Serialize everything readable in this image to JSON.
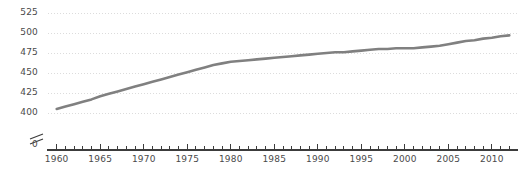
{
  "chart_data": {
    "type": "line",
    "title": "",
    "subtitle": "",
    "xlabel": "",
    "ylabel": "",
    "grid": true,
    "legend": null,
    "legend_position": "none",
    "axis_break": true,
    "axis_break_note": "y-axis broken between 0 and 400",
    "xlim": [
      1959,
      2013
    ],
    "ylim": [
      400,
      530
    ],
    "y_zero_tick": "0",
    "yticks": [
      400,
      425,
      450,
      475,
      500,
      525
    ],
    "ytick_labels": [
      "400",
      "425",
      "450",
      "475",
      "500",
      "525"
    ],
    "xticks": [
      1960,
      1965,
      1970,
      1975,
      1980,
      1985,
      1990,
      1995,
      2000,
      2005,
      2010
    ],
    "xtick_labels": [
      "1960",
      "1965",
      "1970",
      "1975",
      "1980",
      "1985",
      "1990",
      "1995",
      "2000",
      "2005",
      "2010"
    ],
    "x_minor_tick_interval": 1,
    "line_color": "#808080",
    "grid_color": "#dcdcdc",
    "axis_color": "#3c3c3c",
    "text_color": "#4a4a4a",
    "series": [
      {
        "name": "value",
        "x": [
          1960,
          1961,
          1962,
          1963,
          1964,
          1965,
          1966,
          1967,
          1968,
          1969,
          1970,
          1971,
          1972,
          1973,
          1974,
          1975,
          1976,
          1977,
          1978,
          1979,
          1980,
          1981,
          1982,
          1983,
          1984,
          1985,
          1986,
          1987,
          1988,
          1989,
          1990,
          1991,
          1992,
          1993,
          1994,
          1995,
          1996,
          1997,
          1998,
          1999,
          2000,
          2001,
          2002,
          2003,
          2004,
          2005,
          2006,
          2007,
          2008,
          2009,
          2010,
          2011,
          2012
        ],
        "values": [
          405,
          408,
          411,
          414,
          417,
          421,
          424,
          427,
          430,
          433,
          436,
          439,
          442,
          445,
          448,
          451,
          454,
          457,
          460,
          462,
          464,
          465,
          466,
          467,
          468,
          469,
          470,
          471,
          472,
          473,
          474,
          475,
          476,
          476,
          477,
          478,
          479,
          480,
          480,
          481,
          481,
          481,
          482,
          483,
          484,
          486,
          488,
          490,
          491,
          493,
          494,
          496,
          497
        ]
      }
    ]
  }
}
